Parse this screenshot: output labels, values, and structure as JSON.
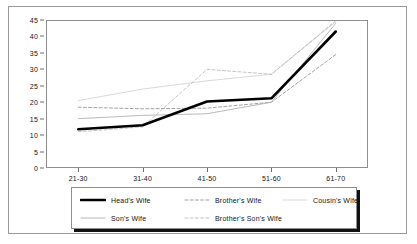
{
  "chart_data": {
    "type": "line",
    "title": "",
    "xlabel": "",
    "ylabel": "",
    "categories": [
      "21-30",
      "31-40",
      "41-50",
      "51-60",
      "61-70"
    ],
    "yticks": [
      0,
      5,
      10,
      15,
      20,
      25,
      30,
      35,
      40,
      45
    ],
    "ylim": [
      0,
      45
    ],
    "grid": false,
    "legend_position": "bottom",
    "series": [
      {
        "name": "Head's Wife",
        "values": [
          11.8,
          13.0,
          20.2,
          21.2,
          41.5
        ],
        "style": "solid",
        "width": "thick",
        "color": "#000000"
      },
      {
        "name": "Brother's Wife",
        "values": [
          18.5,
          18.0,
          18.2,
          20.0,
          34.5
        ],
        "style": "dashed",
        "width": "thin",
        "color": "#8a8a8a"
      },
      {
        "name": "Cousin's Wife",
        "values": [
          20.5,
          24.0,
          26.5,
          28.5,
          44.5
        ],
        "style": "solid",
        "width": "thin",
        "color": "#cfcfcf"
      },
      {
        "name": "Son's Wife",
        "values": [
          15.0,
          16.0,
          16.5,
          20.0,
          44.0
        ],
        "style": "solid",
        "width": "thin",
        "color": "#a8a8a8"
      },
      {
        "name": "Brother's Son's Wife",
        "values": [
          11.0,
          12.5,
          30.0,
          28.5,
          44.8
        ],
        "style": "dashed",
        "width": "thin",
        "color": "#b5b5b5"
      }
    ]
  },
  "legend": {
    "rows": [
      [
        {
          "label": "Head's Wife",
          "series": 0
        },
        {
          "label": "Brother's Wife",
          "series": 1
        },
        {
          "label": "Cousin's Wife",
          "series": 2
        }
      ],
      [
        {
          "label": "Son's Wife",
          "series": 3
        },
        {
          "label": "Brother's Son's Wife",
          "series": 4
        }
      ]
    ]
  }
}
